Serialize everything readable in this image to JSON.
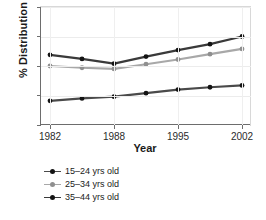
{
  "chart_data": {
    "type": "line",
    "title": "",
    "xlabel": "Year",
    "ylabel": "% Distribution",
    "categories": [
      "1982",
      "1984",
      "1988",
      "1991",
      "1995",
      "1998",
      "2002"
    ],
    "x_tick_labels": [
      "1982",
      "1988",
      "1995",
      "2002"
    ],
    "y_tick_labels": [
      "0",
      "5",
      "10",
      "15",
      "20"
    ],
    "ylim": [
      0,
      20
    ],
    "ytick_values": [
      0,
      5,
      10,
      15,
      20
    ],
    "grid": true,
    "legend_position": "below-left",
    "series": [
      {
        "name": "15–24 yrs old",
        "color": "#4a4a4a",
        "values": [
          4.1,
          4.5,
          4.8,
          5.4,
          6.0,
          6.4,
          6.7
        ]
      },
      {
        "name": "25–34 yrs old",
        "color": "#a8a8a8",
        "values": [
          10.0,
          9.7,
          9.5,
          10.3,
          11.1,
          12.0,
          12.9
        ]
      },
      {
        "name": "35–44 yrs old",
        "color": "#3a3a3a",
        "values": [
          11.9,
          11.2,
          10.4,
          11.6,
          12.7,
          13.7,
          15.0
        ]
      }
    ]
  },
  "axes": {
    "y_title": "% Distribution",
    "x_title": "Year"
  },
  "legend": {
    "items": [
      {
        "label": "15–24 yrs old",
        "color": "#4a4a4a"
      },
      {
        "label": "25–34 yrs old",
        "color": "#a8a8a8"
      },
      {
        "label": "35–44 yrs old",
        "color": "#3a3a3a"
      }
    ]
  }
}
